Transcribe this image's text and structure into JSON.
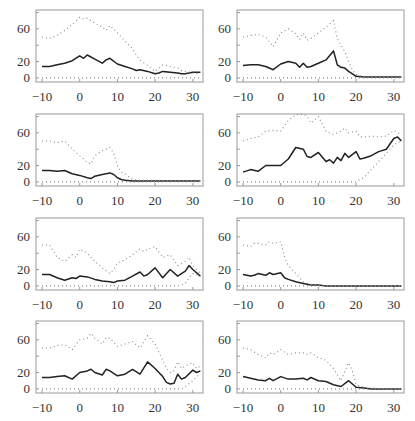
{
  "figure": {
    "width": 415,
    "height": 421,
    "frame_color": "#999999",
    "line_color": "#222222",
    "dot_color": "#888888"
  },
  "chart_data": [
    {
      "type": "line",
      "panel": "row1-left",
      "xlabel": "",
      "ylabel": "",
      "xticks": [
        "-10",
        "0",
        "10",
        "20",
        "30"
      ],
      "yticks": [
        "0",
        "20",
        "60"
      ],
      "xlim": [
        -11.6,
        32.7
      ],
      "ylim": [
        -5,
        83
      ],
      "x": [
        -10,
        -8,
        -6,
        -4,
        -2,
        0,
        1,
        2,
        4,
        6,
        7,
        8,
        10,
        12,
        14,
        15,
        16,
        18,
        20,
        21,
        22,
        24,
        26,
        27,
        28,
        30,
        32
      ],
      "series": [
        {
          "name": "solid",
          "style": "solid",
          "values": [
            14,
            14,
            16,
            18,
            21,
            27,
            24,
            28,
            23,
            18,
            22,
            24,
            17,
            14,
            11,
            9,
            10,
            8,
            5,
            6,
            8,
            7,
            6,
            5,
            5,
            7,
            7
          ]
        },
        {
          "name": "upper",
          "style": "dotted",
          "values": [
            50,
            48,
            52,
            58,
            65,
            74,
            72,
            73,
            67,
            62,
            58,
            64,
            55,
            45,
            36,
            28,
            22,
            15,
            8,
            12,
            16,
            14,
            12,
            9,
            8,
            6,
            5
          ]
        },
        {
          "name": "lower",
          "style": "dotted",
          "values": [
            0,
            0,
            0,
            0,
            0,
            0,
            0,
            0,
            0,
            0,
            0,
            0,
            0,
            0,
            0,
            0,
            0,
            0,
            0,
            0,
            0,
            0,
            0,
            0,
            0,
            0,
            0
          ]
        }
      ]
    },
    {
      "type": "line",
      "panel": "row1-right",
      "xticks": [
        "-10",
        "0",
        "10",
        "20",
        "30"
      ],
      "yticks": [
        "0",
        "20",
        "60"
      ],
      "xlim": [
        -11.6,
        32.7
      ],
      "ylim": [
        -5,
        83
      ],
      "x": [
        -10,
        -8,
        -6,
        -4,
        -2,
        0,
        2,
        4,
        5,
        6,
        7,
        8,
        10,
        12,
        14,
        15,
        16,
        17,
        18,
        19,
        20,
        22,
        26,
        30,
        32
      ],
      "series": [
        {
          "name": "solid",
          "style": "solid",
          "values": [
            15,
            16,
            16,
            14,
            10,
            17,
            20,
            18,
            13,
            18,
            13,
            14,
            18,
            22,
            33,
            16,
            13,
            12,
            8,
            5,
            2,
            1,
            1,
            1,
            1
          ]
        },
        {
          "name": "upper",
          "style": "dotted",
          "values": [
            50,
            52,
            53,
            50,
            38,
            55,
            60,
            54,
            47,
            55,
            46,
            48,
            55,
            62,
            70,
            48,
            40,
            32,
            20,
            10,
            4,
            1,
            1,
            1,
            1
          ]
        },
        {
          "name": "lower",
          "style": "dotted",
          "values": [
            0,
            0,
            0,
            0,
            0,
            0,
            0,
            0,
            0,
            0,
            0,
            0,
            0,
            0,
            0,
            0,
            0,
            0,
            0,
            0,
            0,
            0,
            0,
            0,
            0
          ]
        }
      ]
    },
    {
      "type": "line",
      "panel": "row2-left",
      "xticks": [
        "-10",
        "0",
        "10",
        "20",
        "30"
      ],
      "yticks": [
        "0",
        "20",
        "60"
      ],
      "xlim": [
        -11.6,
        32.7
      ],
      "ylim": [
        -5,
        83
      ],
      "x": [
        -10,
        -8,
        -6,
        -4,
        -2,
        0,
        2,
        3,
        4,
        6,
        8,
        9,
        10,
        11,
        12,
        14,
        16,
        18,
        20,
        22,
        24,
        26,
        28,
        30,
        32
      ],
      "series": [
        {
          "name": "solid",
          "style": "solid",
          "values": [
            14,
            14,
            13,
            14,
            10,
            8,
            5,
            4,
            7,
            9,
            11,
            9,
            5,
            3,
            2,
            1,
            1,
            1,
            1,
            1,
            1,
            1,
            1,
            1,
            1
          ]
        },
        {
          "name": "upper",
          "style": "dotted",
          "values": [
            50,
            50,
            48,
            50,
            40,
            32,
            24,
            22,
            32,
            38,
            42,
            35,
            20,
            12,
            10,
            3,
            2,
            2,
            2,
            1,
            1,
            1,
            1,
            1,
            1
          ]
        },
        {
          "name": "lower",
          "style": "dotted",
          "values": [
            0,
            0,
            0,
            0,
            0,
            0,
            0,
            0,
            0,
            0,
            0,
            0,
            0,
            0,
            0,
            0,
            0,
            0,
            0,
            0,
            0,
            0,
            0,
            0,
            0
          ]
        }
      ]
    },
    {
      "type": "line",
      "panel": "row2-right",
      "xticks": [
        "-10",
        "0",
        "10",
        "20",
        "30"
      ],
      "yticks": [
        "0",
        "20",
        "60"
      ],
      "xlim": [
        -11.6,
        32.7
      ],
      "ylim": [
        -5,
        83
      ],
      "x": [
        -10,
        -8,
        -6,
        -4,
        -2,
        0,
        2,
        4,
        6,
        7,
        8,
        10,
        12,
        13,
        14,
        15,
        16,
        17,
        18,
        20,
        21,
        22,
        24,
        26,
        28,
        30,
        31,
        32
      ],
      "series": [
        {
          "name": "solid",
          "style": "solid",
          "values": [
            12,
            15,
            13,
            20,
            20,
            20,
            28,
            42,
            40,
            31,
            30,
            36,
            25,
            27,
            23,
            30,
            26,
            35,
            30,
            37,
            28,
            29,
            32,
            37,
            40,
            53,
            55,
            50
          ]
        },
        {
          "name": "upper",
          "style": "dotted",
          "values": [
            50,
            53,
            55,
            62,
            63,
            62,
            75,
            82,
            83,
            80,
            72,
            80,
            62,
            60,
            58,
            60,
            62,
            66,
            60,
            62,
            55,
            55,
            56,
            55,
            56,
            63,
            60,
            58
          ]
        },
        {
          "name": "lower",
          "style": "dotted",
          "values": [
            0,
            0,
            0,
            0,
            0,
            0,
            0,
            0,
            0,
            0,
            0,
            0,
            0,
            0,
            0,
            0,
            0,
            0,
            0,
            0,
            3,
            5,
            15,
            25,
            35,
            45,
            48,
            50
          ]
        }
      ]
    },
    {
      "type": "line",
      "panel": "row3-left",
      "xticks": [
        "-10",
        "0",
        "10",
        "20",
        "30"
      ],
      "yticks": [
        "0",
        "20",
        "60"
      ],
      "xlim": [
        -11.6,
        32.7
      ],
      "ylim": [
        -5,
        83
      ],
      "x": [
        -10,
        -8,
        -6,
        -4,
        -2,
        -1,
        0,
        2,
        4,
        6,
        8,
        9,
        10,
        12,
        14,
        16,
        17,
        18,
        20,
        22,
        24,
        26,
        28,
        29,
        30,
        32
      ],
      "series": [
        {
          "name": "solid",
          "style": "solid",
          "values": [
            14,
            14,
            10,
            7,
            10,
            9,
            12,
            11,
            8,
            6,
            5,
            4,
            6,
            7,
            12,
            17,
            12,
            14,
            22,
            10,
            20,
            12,
            18,
            25,
            20,
            12
          ]
        },
        {
          "name": "upper",
          "style": "dotted",
          "values": [
            50,
            50,
            35,
            30,
            38,
            35,
            45,
            40,
            30,
            22,
            15,
            20,
            28,
            32,
            38,
            45,
            42,
            45,
            48,
            35,
            38,
            25,
            30,
            35,
            25,
            15
          ]
        },
        {
          "name": "lower",
          "style": "dotted",
          "values": [
            0,
            0,
            0,
            0,
            0,
            0,
            0,
            0,
            0,
            0,
            0,
            0,
            0,
            0,
            0,
            0,
            0,
            0,
            0,
            0,
            0,
            0,
            3,
            10,
            15,
            12
          ]
        }
      ]
    },
    {
      "type": "line",
      "panel": "row3-right",
      "xticks": [
        "-10",
        "0",
        "10",
        "20",
        "30"
      ],
      "yticks": [
        "0",
        "20",
        "60"
      ],
      "xlim": [
        -11.6,
        32.7
      ],
      "ylim": [
        -5,
        83
      ],
      "x": [
        -10,
        -8,
        -7,
        -6,
        -4,
        -3,
        -2,
        0,
        1,
        2,
        4,
        6,
        8,
        10,
        12,
        16,
        20,
        24,
        28,
        32
      ],
      "series": [
        {
          "name": "solid",
          "style": "solid",
          "values": [
            14,
            12,
            13,
            15,
            13,
            16,
            14,
            16,
            10,
            8,
            5,
            3,
            1,
            1,
            0,
            0,
            0,
            0,
            0,
            0
          ]
        },
        {
          "name": "upper",
          "style": "dotted",
          "values": [
            50,
            48,
            52,
            52,
            50,
            54,
            52,
            54,
            35,
            25,
            15,
            5,
            2,
            1,
            0,
            0,
            0,
            0,
            0,
            0
          ]
        },
        {
          "name": "lower",
          "style": "dotted",
          "values": [
            0,
            0,
            0,
            0,
            0,
            0,
            0,
            0,
            0,
            0,
            0,
            0,
            0,
            0,
            0,
            0,
            0,
            0,
            0,
            0
          ]
        }
      ]
    },
    {
      "type": "line",
      "panel": "row4-left",
      "xticks": [
        "-10",
        "0",
        "10",
        "20",
        "30"
      ],
      "yticks": [
        "0",
        "20",
        "60"
      ],
      "xlim": [
        -11.6,
        32.7
      ],
      "ylim": [
        -5,
        83
      ],
      "x": [
        -10,
        -8,
        -6,
        -4,
        -2,
        0,
        2,
        3,
        4,
        6,
        7,
        8,
        10,
        12,
        14,
        16,
        18,
        20,
        22,
        23,
        24,
        25,
        26,
        27,
        28,
        30,
        31,
        32
      ],
      "series": [
        {
          "name": "solid",
          "style": "solid",
          "values": [
            14,
            14,
            15,
            16,
            12,
            20,
            22,
            24,
            20,
            17,
            24,
            22,
            16,
            18,
            24,
            18,
            33,
            25,
            15,
            8,
            6,
            7,
            18,
            12,
            14,
            23,
            20,
            22
          ]
        },
        {
          "name": "upper",
          "style": "dotted",
          "values": [
            50,
            50,
            53,
            54,
            48,
            60,
            62,
            68,
            62,
            55,
            63,
            62,
            52,
            55,
            58,
            50,
            65,
            55,
            35,
            25,
            20,
            22,
            33,
            25,
            28,
            32,
            25,
            28
          ]
        },
        {
          "name": "lower",
          "style": "dotted",
          "values": [
            0,
            0,
            0,
            0,
            0,
            0,
            0,
            0,
            0,
            0,
            0,
            0,
            0,
            0,
            0,
            0,
            0,
            0,
            0,
            0,
            0,
            0,
            0,
            0,
            3,
            10,
            15,
            18
          ]
        }
      ]
    },
    {
      "type": "line",
      "panel": "row4-right",
      "xticks": [
        "-10",
        "0",
        "10",
        "20",
        "30"
      ],
      "yticks": [
        "0",
        "20",
        "60"
      ],
      "xlim": [
        -11.6,
        32.7
      ],
      "ylim": [
        -5,
        83
      ],
      "x": [
        -10,
        -8,
        -6,
        -4,
        -3,
        -2,
        0,
        2,
        4,
        6,
        7,
        8,
        10,
        12,
        14,
        16,
        18,
        19,
        20,
        22,
        24,
        28,
        32
      ],
      "series": [
        {
          "name": "solid",
          "style": "solid",
          "values": [
            15,
            13,
            11,
            10,
            13,
            10,
            15,
            12,
            12,
            13,
            11,
            14,
            10,
            9,
            5,
            3,
            10,
            6,
            2,
            1,
            0,
            0,
            0
          ]
        },
        {
          "name": "upper",
          "style": "dotted",
          "values": [
            50,
            48,
            42,
            38,
            44,
            42,
            48,
            42,
            44,
            44,
            42,
            44,
            38,
            35,
            25,
            10,
            32,
            22,
            5,
            2,
            1,
            0,
            0
          ]
        },
        {
          "name": "lower",
          "style": "dotted",
          "values": [
            0,
            0,
            0,
            0,
            0,
            0,
            0,
            0,
            0,
            0,
            0,
            0,
            0,
            0,
            0,
            0,
            0,
            0,
            0,
            0,
            0,
            0,
            0
          ]
        }
      ]
    }
  ],
  "layout": {
    "panels": [
      {
        "left": 36,
        "top": 10,
        "w": 167,
        "h": 72
      },
      {
        "left": 237,
        "top": 10,
        "w": 167,
        "h": 72
      },
      {
        "left": 36,
        "top": 114,
        "w": 167,
        "h": 72
      },
      {
        "left": 237,
        "top": 114,
        "w": 167,
        "h": 72
      },
      {
        "left": 36,
        "top": 218,
        "w": 167,
        "h": 72
      },
      {
        "left": 237,
        "top": 218,
        "w": 167,
        "h": 72
      },
      {
        "left": 36,
        "top": 321,
        "w": 167,
        "h": 72
      },
      {
        "left": 237,
        "top": 321,
        "w": 167,
        "h": 72
      }
    ]
  }
}
